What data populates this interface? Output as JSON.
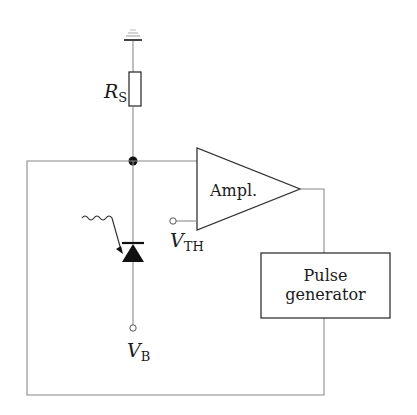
{
  "diagram": {
    "type": "circuit-schematic",
    "components": {
      "ground": {
        "label": ""
      },
      "resistor": {
        "symbol": "R",
        "subscript": "S"
      },
      "photodiode": {
        "label": ""
      },
      "bias_terminal": {
        "symbol": "V",
        "subscript": "B"
      },
      "amplifier": {
        "label": "Ampl."
      },
      "threshold_terminal": {
        "symbol": "V",
        "subscript": "TH"
      },
      "pulse_generator": {
        "line1": "Pulse",
        "line2": "generator"
      }
    },
    "colors": {
      "wire": "#8a8a8a",
      "component": "#333333",
      "fill": "#1a1a1a",
      "background": "#ffffff"
    }
  }
}
